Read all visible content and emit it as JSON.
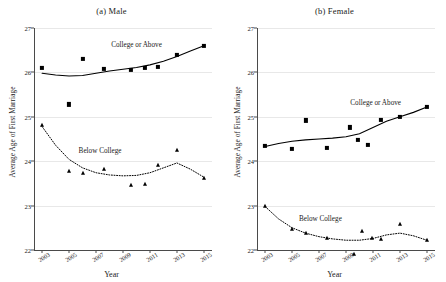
{
  "chart_data": {
    "type": "scatter",
    "title": "",
    "xlabel": "Year",
    "ylabel": "Average Age of First Marriage",
    "xlim": [
      2002.4,
      2015.6
    ],
    "ylim": [
      22,
      27
    ],
    "xticks": [
      "2003",
      "2005",
      "2007",
      "2009",
      "2011",
      "2013",
      "2015"
    ],
    "yticks": [
      "22",
      "23",
      "24",
      "25",
      "26",
      "27"
    ],
    "grid": true,
    "legend_position": "inline-annotation",
    "panels": [
      {
        "key": "male",
        "title": "(a) Male",
        "series": [
          {
            "name": "College or Above",
            "marker": "square",
            "line": "solid",
            "annotation": "College or Above",
            "annotation_x": 2010.0,
            "annotation_y": 26.62,
            "points": [
              {
                "x": 2003.0,
                "y": 26.1
              },
              {
                "x": 2005.0,
                "y": 25.28
              },
              {
                "x": 2006.0,
                "y": 26.3
              },
              {
                "x": 2007.6,
                "y": 26.08
              },
              {
                "x": 2009.6,
                "y": 26.05
              },
              {
                "x": 2010.6,
                "y": 26.1
              },
              {
                "x": 2011.6,
                "y": 26.13
              },
              {
                "x": 2013.0,
                "y": 26.4
              },
              {
                "x": 2015.0,
                "y": 26.6
              }
            ],
            "fit": [
              {
                "x": 2003.0,
                "y": 25.98
              },
              {
                "x": 2004.0,
                "y": 25.94
              },
              {
                "x": 2005.0,
                "y": 25.92
              },
              {
                "x": 2006.0,
                "y": 25.93
              },
              {
                "x": 2007.0,
                "y": 25.98
              },
              {
                "x": 2008.0,
                "y": 26.03
              },
              {
                "x": 2009.0,
                "y": 26.07
              },
              {
                "x": 2010.0,
                "y": 26.11
              },
              {
                "x": 2011.0,
                "y": 26.17
              },
              {
                "x": 2012.0,
                "y": 26.25
              },
              {
                "x": 2013.0,
                "y": 26.36
              },
              {
                "x": 2014.0,
                "y": 26.48
              },
              {
                "x": 2015.0,
                "y": 26.6
              }
            ]
          },
          {
            "name": "Below College",
            "marker": "triangle",
            "line": "dotted",
            "annotation": "Below College",
            "annotation_x": 2007.3,
            "annotation_y": 24.22,
            "points": [
              {
                "x": 2003.0,
                "y": 24.82
              },
              {
                "x": 2005.0,
                "y": 23.78
              },
              {
                "x": 2006.0,
                "y": 23.74
              },
              {
                "x": 2007.6,
                "y": 23.82
              },
              {
                "x": 2009.6,
                "y": 23.47
              },
              {
                "x": 2010.6,
                "y": 23.48
              },
              {
                "x": 2011.6,
                "y": 23.92
              },
              {
                "x": 2013.0,
                "y": 24.25
              },
              {
                "x": 2015.0,
                "y": 23.63
              }
            ],
            "fit": [
              {
                "x": 2003.0,
                "y": 24.78
              },
              {
                "x": 2004.0,
                "y": 24.36
              },
              {
                "x": 2005.0,
                "y": 24.04
              },
              {
                "x": 2006.0,
                "y": 23.85
              },
              {
                "x": 2007.0,
                "y": 23.74
              },
              {
                "x": 2008.0,
                "y": 23.69
              },
              {
                "x": 2009.0,
                "y": 23.67
              },
              {
                "x": 2010.0,
                "y": 23.68
              },
              {
                "x": 2011.0,
                "y": 23.74
              },
              {
                "x": 2012.0,
                "y": 23.85
              },
              {
                "x": 2013.0,
                "y": 23.96
              },
              {
                "x": 2014.0,
                "y": 23.82
              },
              {
                "x": 2015.0,
                "y": 23.64
              }
            ]
          }
        ]
      },
      {
        "key": "female",
        "title": "(b) Female",
        "series": [
          {
            "name": "College or Above",
            "marker": "square",
            "line": "solid",
            "annotation": "College or Above",
            "annotation_x": 2011.2,
            "annotation_y": 25.32,
            "points": [
              {
                "x": 2003.0,
                "y": 24.35
              },
              {
                "x": 2005.0,
                "y": 24.28
              },
              {
                "x": 2006.0,
                "y": 24.92
              },
              {
                "x": 2007.6,
                "y": 24.3
              },
              {
                "x": 2009.3,
                "y": 24.76
              },
              {
                "x": 2009.9,
                "y": 24.48
              },
              {
                "x": 2010.6,
                "y": 24.36
              },
              {
                "x": 2011.6,
                "y": 24.93
              },
              {
                "x": 2013.0,
                "y": 25.0
              },
              {
                "x": 2015.0,
                "y": 25.22
              }
            ],
            "fit": [
              {
                "x": 2003.0,
                "y": 24.33
              },
              {
                "x": 2004.0,
                "y": 24.4
              },
              {
                "x": 2005.0,
                "y": 24.45
              },
              {
                "x": 2006.0,
                "y": 24.48
              },
              {
                "x": 2007.0,
                "y": 24.5
              },
              {
                "x": 2008.0,
                "y": 24.52
              },
              {
                "x": 2009.0,
                "y": 24.55
              },
              {
                "x": 2010.0,
                "y": 24.62
              },
              {
                "x": 2011.0,
                "y": 24.76
              },
              {
                "x": 2012.0,
                "y": 24.9
              },
              {
                "x": 2013.0,
                "y": 25.0
              },
              {
                "x": 2014.0,
                "y": 25.1
              },
              {
                "x": 2015.0,
                "y": 25.22
              }
            ]
          },
          {
            "name": "Below College",
            "marker": "triangle",
            "line": "dotted",
            "annotation": "Below College",
            "annotation_x": 2007.1,
            "annotation_y": 22.7,
            "points": [
              {
                "x": 2003.0,
                "y": 23.0
              },
              {
                "x": 2005.0,
                "y": 22.48
              },
              {
                "x": 2006.0,
                "y": 22.38
              },
              {
                "x": 2007.6,
                "y": 22.28
              },
              {
                "x": 2009.6,
                "y": 21.92
              },
              {
                "x": 2010.2,
                "y": 22.42
              },
              {
                "x": 2010.9,
                "y": 22.28
              },
              {
                "x": 2011.6,
                "y": 22.25
              },
              {
                "x": 2013.0,
                "y": 22.58
              },
              {
                "x": 2015.0,
                "y": 22.22
              }
            ],
            "fit": [
              {
                "x": 2003.0,
                "y": 22.98
              },
              {
                "x": 2004.0,
                "y": 22.7
              },
              {
                "x": 2005.0,
                "y": 22.5
              },
              {
                "x": 2006.0,
                "y": 22.38
              },
              {
                "x": 2007.0,
                "y": 22.3
              },
              {
                "x": 2008.0,
                "y": 22.25
              },
              {
                "x": 2009.0,
                "y": 22.22
              },
              {
                "x": 2010.0,
                "y": 22.22
              },
              {
                "x": 2011.0,
                "y": 22.26
              },
              {
                "x": 2012.0,
                "y": 22.34
              },
              {
                "x": 2013.0,
                "y": 22.38
              },
              {
                "x": 2014.0,
                "y": 22.32
              },
              {
                "x": 2015.0,
                "y": 22.22
              }
            ]
          }
        ]
      }
    ]
  }
}
